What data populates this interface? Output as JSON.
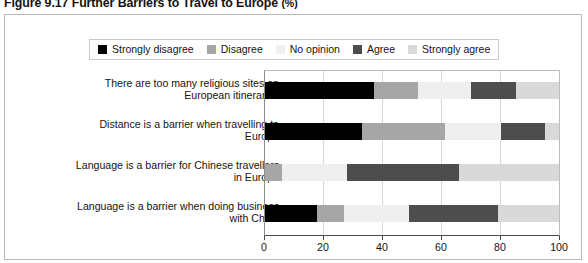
{
  "title": {
    "figure_number": "Figure 9.17",
    "text": "Further Barriers to Travel to Europe",
    "unit": "(%)",
    "full": "Figure 9.17  Further Barriers to Travel to Europe (%)"
  },
  "colors": {
    "strongly_disagree": "#000000",
    "disagree": "#a6a6a6",
    "no_opinion": "#efefef",
    "agree": "#4d4d4d",
    "strongly_agree": "#d9d9d9",
    "axis": "#4a4a4a",
    "frame": "#b9b9b9",
    "text": "#18130f"
  },
  "legend": {
    "position": "top",
    "items": [
      {
        "label": "Strongly disagree",
        "color": "#000000"
      },
      {
        "label": "Disagree",
        "color": "#a6a6a6"
      },
      {
        "label": "No opinion",
        "color": "#efefef"
      },
      {
        "label": "Agree",
        "color": "#4d4d4d"
      },
      {
        "label": "Strongly agree",
        "color": "#d9d9d9"
      }
    ]
  },
  "axis": {
    "ticks": [
      "0",
      "20",
      "40",
      "60",
      "80",
      "100"
    ],
    "min": 0,
    "max": 100
  },
  "categories": [
    {
      "line1": "There are too many religious sites on",
      "line2": "European itineraries"
    },
    {
      "line1": "Distance is a barrier when travelling to",
      "line2": "Europe"
    },
    {
      "line1": "Language is a barrier for Chinese travellers",
      "line2": "in Europe"
    },
    {
      "line1": "Language is a barrier when doing business",
      "line2": "with China"
    }
  ],
  "chart_data": {
    "type": "bar",
    "orientation": "horizontal",
    "stacked": true,
    "stack_total": 100,
    "title": "Figure 9.17  Further Barriers to Travel to Europe (%)",
    "xlabel": "",
    "ylabel": "",
    "xlim": [
      0,
      100
    ],
    "xticks": [
      0,
      20,
      40,
      60,
      80,
      100
    ],
    "grid": true,
    "legend_position": "top",
    "categories": [
      "There are too many religious sites on European itineraries",
      "Distance is a barrier when travelling to Europe",
      "Language is a barrier for Chinese travellers in Europe",
      "Language is a barrier when doing business with China"
    ],
    "series": [
      {
        "name": "Strongly disagree",
        "color": "#000000",
        "values": [
          37,
          33,
          0,
          18
        ]
      },
      {
        "name": "Disagree",
        "color": "#a6a6a6",
        "values": [
          15,
          28,
          6,
          9
        ]
      },
      {
        "name": "No opinion",
        "color": "#efefef",
        "values": [
          18,
          19,
          22,
          22
        ]
      },
      {
        "name": "Agree",
        "color": "#4d4d4d",
        "values": [
          15,
          15,
          38,
          30
        ]
      },
      {
        "name": "Strongly agree",
        "color": "#d9d9d9",
        "values": [
          15,
          5,
          34,
          21
        ]
      }
    ]
  }
}
